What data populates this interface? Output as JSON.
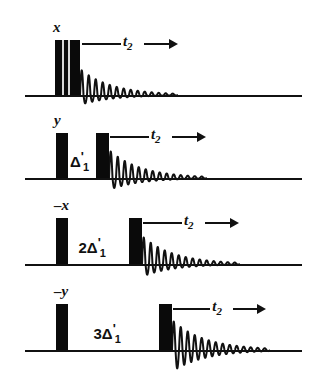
{
  "figure": {
    "type": "pulse-sequence",
    "background_color": "#ffffff",
    "ink_color": "#111111",
    "width": 323,
    "height": 392,
    "row_count": 4
  },
  "rows": [
    {
      "index": 0,
      "phase_label": "x",
      "delay_label": "",
      "acquisition_label": "t",
      "acquisition_sub": "2",
      "baseline_y": 95,
      "baseline_x0": 25,
      "baseline_x1": 302,
      "pulses": [
        {
          "name": "composite-pulse",
          "x": 55,
          "width": 25,
          "height": 55,
          "composite": true
        }
      ],
      "fid": {
        "start_x": 80,
        "cycles": 14,
        "amplitude": 26,
        "length": 98,
        "decay": 3.1,
        "below_baseline": 0.38
      },
      "arrow": {
        "x0": 82,
        "x1": 178,
        "y_offset": -52
      }
    },
    {
      "index": 1,
      "phase_label": "y",
      "delay_label": "Δ",
      "delay_prefix": "",
      "delay_prime": "'",
      "delay_sub": "1",
      "acquisition_label": "t",
      "acquisition_sub": "2",
      "baseline_y": 178,
      "baseline_x0": 25,
      "baseline_x1": 302,
      "pulses": [
        {
          "name": "preparation-pulse",
          "x": 56,
          "width": 12,
          "height": 45,
          "composite": false
        },
        {
          "name": "read-pulse",
          "x": 96,
          "width": 13,
          "height": 45,
          "composite": false
        }
      ],
      "fid": {
        "start_x": 109,
        "cycles": 14,
        "amplitude": 28,
        "length": 98,
        "decay": 3.1,
        "below_baseline": 0.42
      },
      "arrow": {
        "x0": 110,
        "x1": 206,
        "y_offset": -42
      }
    },
    {
      "index": 2,
      "phase_label": "–x",
      "delay_label": "Δ",
      "delay_prefix": "2",
      "delay_prime": "'",
      "delay_sub": "1",
      "acquisition_label": "t",
      "acquisition_sub": "2",
      "baseline_y": 264,
      "baseline_x0": 25,
      "baseline_x1": 302,
      "pulses": [
        {
          "name": "preparation-pulse",
          "x": 56,
          "width": 12,
          "height": 46,
          "composite": false
        },
        {
          "name": "read-pulse",
          "x": 129,
          "width": 13,
          "height": 46,
          "composite": false
        }
      ],
      "fid": {
        "start_x": 142,
        "cycles": 14,
        "amplitude": 28,
        "length": 98,
        "decay": 3.1,
        "below_baseline": 0.45
      },
      "arrow": {
        "x0": 143,
        "x1": 239,
        "y_offset": -42
      }
    },
    {
      "index": 3,
      "phase_label": "–y",
      "delay_label": "Δ",
      "delay_prefix": "3",
      "delay_prime": "'",
      "delay_sub": "1",
      "acquisition_label": "t",
      "acquisition_sub": "2",
      "baseline_y": 350,
      "baseline_x0": 25,
      "baseline_x1": 302,
      "pulses": [
        {
          "name": "preparation-pulse",
          "x": 56,
          "width": 12,
          "height": 46,
          "composite": false
        },
        {
          "name": "read-pulse",
          "x": 159,
          "width": 13,
          "height": 46,
          "composite": false
        }
      ],
      "fid": {
        "start_x": 172,
        "cycles": 14,
        "amplitude": 30,
        "length": 98,
        "decay": 3.0,
        "below_baseline": 0.72
      },
      "arrow": {
        "x0": 173,
        "x1": 266,
        "y_offset": -42
      }
    }
  ]
}
